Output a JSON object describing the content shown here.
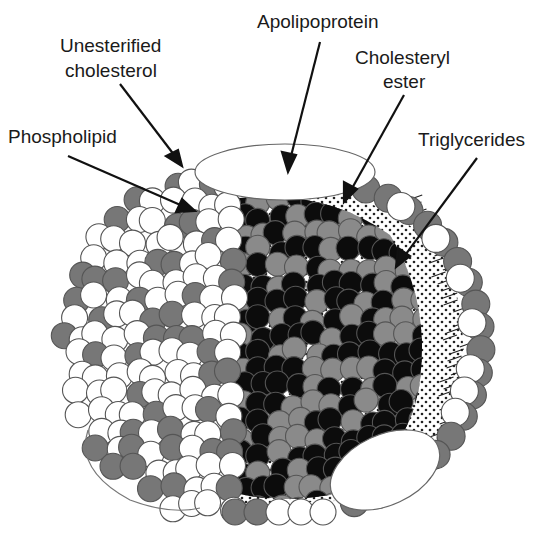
{
  "labels": {
    "apolipoprotein": "Apolipoprotein",
    "unesterified_line1": "Unesterified",
    "unesterified_line2": "cholesterol",
    "phospholipid": "Phospholipid",
    "cholesteryl_line1": "Cholesteryl",
    "cholesteryl_line2": "ester",
    "triglycerides": "Triglycerides"
  },
  "colors": {
    "phospholipid": "#ffffff",
    "unesterified_cholesterol": "#777777",
    "cholesteryl_ester": "#0c0c0c",
    "triglycerides": "#8a8a8a",
    "outline": "#555555",
    "arrow": "#111111"
  }
}
